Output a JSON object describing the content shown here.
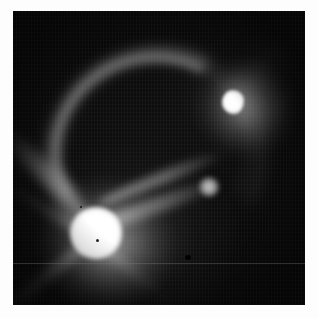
{
  "image": {
    "kind": "grayscale-astronomical-exposure",
    "title": "",
    "frame": {
      "border_color": "#fdfdfd",
      "background_color": "#0a0a0a",
      "x": 13,
      "y": 11,
      "width": 292,
      "height": 294
    },
    "colors": {
      "background": "#0a0a0a",
      "faint_nebulosity": "#3c3c3c",
      "mid_glow": "#8f8f8f",
      "bright_halo": "#c8c8c8",
      "saturated_core": "#ffffff",
      "border": "#fdfdfd"
    },
    "features": [
      {
        "id": "source-main",
        "label": "Main saturated source",
        "description": "Brightest round saturated blob in the lower-left quadrant with an extended halo and diffraction spikes",
        "center_x": 93,
        "center_y": 232,
        "core_radius": 23,
        "halo_radius": 62,
        "peak_level": "saturated-white"
      },
      {
        "id": "source-secondary",
        "label": "Secondary source",
        "description": "Irregular bright knot in the upper-right quadrant surrounded by a soft diffuse halo",
        "center_x": 231,
        "center_y": 99,
        "core_radius": 11,
        "halo_radius": 44,
        "peak_level": "saturated-white"
      },
      {
        "id": "blob-companion",
        "label": "Small companion blob",
        "description": "Compact round knot along the diagonal band, mid-right of frame",
        "center_x": 207,
        "center_y": 186,
        "core_radius": 9,
        "peak_level": "bright-gray"
      },
      {
        "id": "arc-shell",
        "label": "Curved arc / shell",
        "description": "Bright curved filament arcing across the upper half of the frame, brightest near the apex",
        "apex_x": 130,
        "apex_y": 68,
        "peak_level": "mid-gray"
      },
      {
        "id": "band-upper",
        "label": "Upper diagonal band",
        "description": "Narrow elongated band running up-right from the main source toward the companion blob",
        "peak_level": "mid-gray"
      },
      {
        "id": "band-lower",
        "label": "Lower diagonal band",
        "description": "Brighter, wider elongated band parallel to the upper band",
        "peak_level": "bright-gray"
      },
      {
        "id": "plume",
        "label": "Upper-right plume",
        "description": "Faint diffuse plume extending up and to the right from the secondary source toward the frame corner",
        "peak_level": "faint-gray"
      },
      {
        "id": "spike-sw",
        "label": "Diffraction spike (south-west)",
        "description": "Linear spike radiating from the main source toward the lower-left corner",
        "peak_level": "mid-gray"
      },
      {
        "id": "spike-nw",
        "label": "Diffraction spike (north-west)",
        "description": "Linear spike radiating from the main source toward the upper left",
        "peak_level": "mid-gray"
      },
      {
        "id": "spike-se",
        "label": "Diffraction spike (south-east)",
        "description": "Linear spike radiating from the main source toward the lower right",
        "peak_level": "mid-gray"
      }
    ],
    "artifacts": [
      {
        "id": "scan-line",
        "label": "Horizontal readout line",
        "description": "Faint single-pixel horizontal detector readout line crossing the full frame",
        "y": 263
      },
      {
        "id": "speck-a",
        "label": "Dark speck",
        "description": "Dark dust speck / dead pixel cluster right of the main source",
        "x": 187,
        "y": 257
      },
      {
        "id": "speck-b",
        "label": "Dark speck",
        "description": "Dark pixel within the saturated core of the main source",
        "x": 98,
        "y": 241
      },
      {
        "id": "speck-c",
        "label": "Dark speck",
        "description": "Small dark pixel above-left of the main source core",
        "x": 82,
        "y": 208
      },
      {
        "id": "column-noise",
        "label": "Column striping noise",
        "description": "Low-level vertical column striping and fixed-pattern sensor noise across the dark background"
      }
    ]
  }
}
